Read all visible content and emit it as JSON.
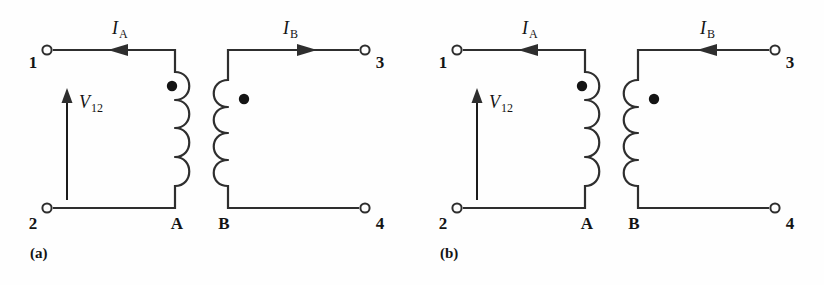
{
  "figure": {
    "type": "circuit-diagram",
    "background_color": "#fefefe",
    "line_color": "#2e2e2e",
    "dot_color": "#141414",
    "width": 824,
    "height": 285
  },
  "panels": [
    {
      "id": "a",
      "caption": "(a)",
      "terminals": [
        {
          "name": "terminal-1",
          "label": "1",
          "position": "top-left"
        },
        {
          "name": "terminal-2",
          "label": "2",
          "position": "bottom-left"
        },
        {
          "name": "terminal-3",
          "label": "3",
          "position": "top-right"
        },
        {
          "name": "terminal-4",
          "label": "4",
          "position": "bottom-right"
        }
      ],
      "coil_nodes": [
        {
          "name": "node-a",
          "label": "A"
        },
        {
          "name": "node-b",
          "label": "B"
        }
      ],
      "currents": [
        {
          "name": "current-ia",
          "symbol": "I",
          "subscript": "A",
          "direction": "right"
        },
        {
          "name": "current-ib",
          "symbol": "I",
          "subscript": "B",
          "direction": "left"
        }
      ],
      "voltage": {
        "name": "voltage-v12",
        "symbol": "V",
        "subscript": "12",
        "direction": "up"
      },
      "dots": [
        {
          "name": "dot-primary",
          "coil": "left",
          "side": "left-of-coil",
          "vertical": "top"
        },
        {
          "name": "dot-secondary",
          "coil": "right",
          "side": "right-of-coil",
          "vertical": "top"
        }
      ]
    },
    {
      "id": "b",
      "caption": "(b)",
      "terminals": [
        {
          "name": "terminal-1",
          "label": "1",
          "position": "top-left"
        },
        {
          "name": "terminal-2",
          "label": "2",
          "position": "bottom-left"
        },
        {
          "name": "terminal-3",
          "label": "3",
          "position": "top-right"
        },
        {
          "name": "terminal-4",
          "label": "4",
          "position": "bottom-right"
        }
      ],
      "coil_nodes": [
        {
          "name": "node-a",
          "label": "A"
        },
        {
          "name": "node-b",
          "label": "B"
        }
      ],
      "currents": [
        {
          "name": "current-ia",
          "symbol": "I",
          "subscript": "A",
          "direction": "right"
        },
        {
          "name": "current-ib",
          "symbol": "I",
          "subscript": "B",
          "direction": "right"
        }
      ],
      "voltage": {
        "name": "voltage-v12",
        "symbol": "V",
        "subscript": "12",
        "direction": "up"
      },
      "dots": [
        {
          "name": "dot-primary",
          "coil": "left",
          "side": "left-of-coil",
          "vertical": "top"
        },
        {
          "name": "dot-secondary",
          "coil": "right",
          "side": "right-of-coil",
          "vertical": "top"
        }
      ]
    }
  ],
  "labels": {
    "panel_a_caption": "(a)",
    "panel_b_caption": "(b)",
    "t1": "1",
    "t2": "2",
    "t3": "3",
    "t4": "4",
    "nodeA": "A",
    "nodeB": "B",
    "I": "I",
    "subA": "A",
    "subB": "B",
    "V": "V",
    "sub12": "12"
  }
}
